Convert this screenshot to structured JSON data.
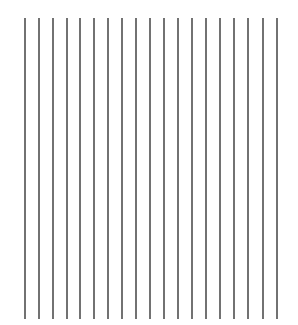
{
  "figure": {
    "line_count": 19,
    "line_color": "#666666",
    "line_width": 2,
    "top": 18,
    "bottom": 319,
    "x_positions": [
      25,
      39,
      53,
      67,
      80,
      94,
      108,
      122,
      136,
      150,
      164,
      178,
      192,
      206,
      220,
      234,
      248,
      263,
      277
    ]
  }
}
